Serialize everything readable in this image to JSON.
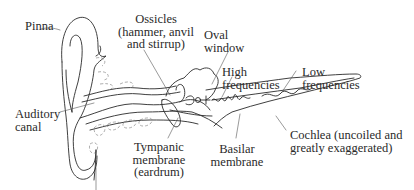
{
  "diagram": {
    "type": "anatomy-of-the-ear",
    "labels": {
      "pinna": "Pinna",
      "ossicles": "Ossicles\n(hammer, anvil\nand stirrup)",
      "oval_window": "Oval\nwindow",
      "high_frequencies": "High\nfrequencies",
      "low_frequencies": "Low\nfrequencies",
      "auditory_canal": "Auditory\ncanal",
      "tympanic_membrane": "Tympanic\nmembrane\n(eardrum)",
      "basilar_membrane": "Basilar\nmembrane",
      "cochlea": "Cochlea (uncoiled and\ngreatly exaggerated)"
    },
    "colors": {
      "line": "#2a2a2a",
      "background": "#ffffff"
    }
  }
}
